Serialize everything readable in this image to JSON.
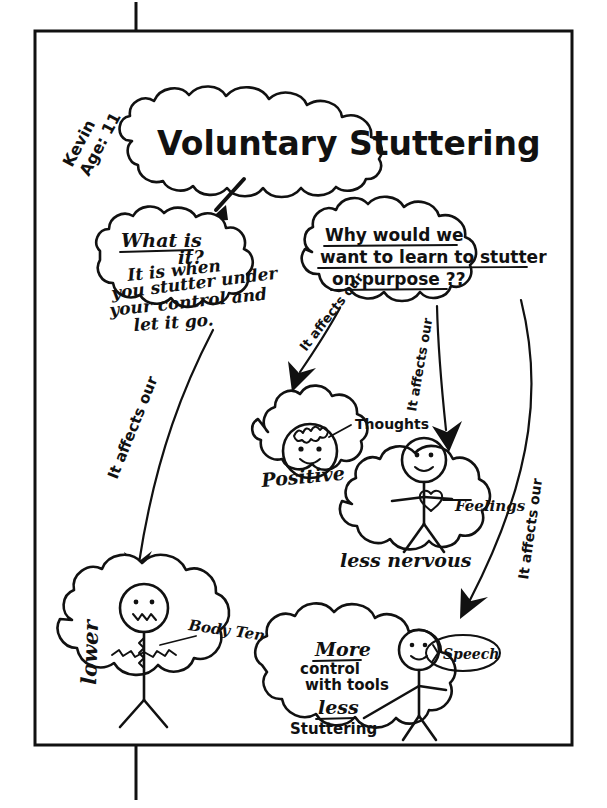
{
  "document": {
    "type": "hand-drawn mind map worksheet",
    "title": "Voluntary Stuttering",
    "author_note": {
      "name": "Kevin",
      "age_label": "Age: 11"
    }
  },
  "central_node": {
    "label": "Voluntary Stuttering"
  },
  "definition_node": {
    "heading": "What is",
    "line1": "it?",
    "line2": "It is when",
    "line3": "you stutter under",
    "line4": "your control and",
    "line5": "let it go."
  },
  "question_node": {
    "line1": "Why would we",
    "line2": "want to learn to stutter",
    "line3": "on purpose ??"
  },
  "branches": [
    {
      "id": "branch-body",
      "label": "It affects our",
      "target": "lower-body-tension"
    },
    {
      "id": "branch-thoughts",
      "label": "It affects our",
      "target": "positive-thoughts"
    },
    {
      "id": "branch-feelings",
      "label": "It affects our",
      "target": "less-nervous-feelings"
    },
    {
      "id": "branch-speech",
      "label": "It affects our",
      "target": "more-control-speech"
    }
  ],
  "outcome_nodes": [
    {
      "id": "positive-thoughts",
      "callout": "Thoughts",
      "caption": "Positive",
      "icon": "smiley-face-with-scribble-brain"
    },
    {
      "id": "less-nervous-feelings",
      "callout": "Feelings",
      "caption": "less nervous",
      "icon": "stick-figure-with-heart"
    },
    {
      "id": "lower-body-tension",
      "callout": "Body Tension",
      "caption": "lower",
      "icon": "stick-figure-scribbled-tense"
    },
    {
      "id": "more-control-speech",
      "callout": "Speech",
      "caption_line1": "More",
      "caption_line2": "control",
      "caption_line3": "with tools",
      "caption_line4": "less",
      "caption_line5": "Stuttering",
      "icon": "stick-figure-with-speech-bubble"
    }
  ],
  "colors": {
    "ink": "#111111",
    "paper": "#ffffff"
  }
}
